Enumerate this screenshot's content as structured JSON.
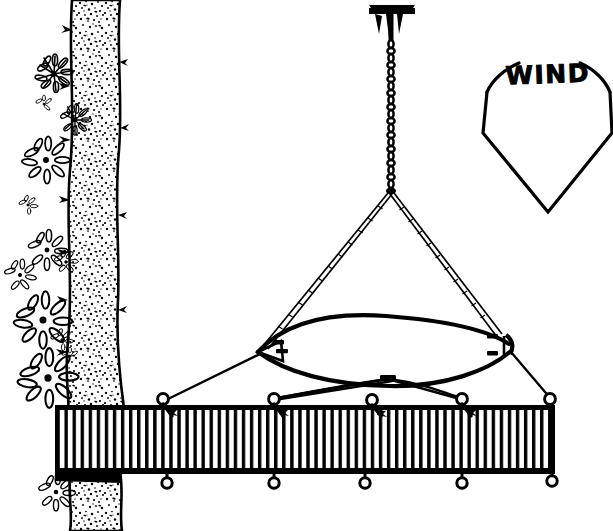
{
  "illustration": {
    "title": "Hammock suspended from ceiling chain over a deck",
    "subject": "hammock-suspension-diagram",
    "line_color": "#000000",
    "background_color": "#ffffff",
    "canvas": {
      "width": 613,
      "height": 531
    }
  },
  "annotations": {
    "wind": {
      "label": "WIND",
      "icon": "wind-direction-arrow",
      "description": "kite-shaped downward pointing wind direction indicator",
      "position": {
        "x": 548,
        "y": 130
      }
    }
  },
  "parts": {
    "ceiling_anchor": {
      "name": "ceiling-mount-bracket",
      "label": "ceiling anchor plate with prongs",
      "position": {
        "x": 391,
        "y": 14
      }
    },
    "chain": {
      "name": "suspension-chain",
      "label": "chain",
      "links": 22,
      "top": {
        "x": 391,
        "y": 38
      },
      "bottom": {
        "x": 391,
        "y": 190
      }
    },
    "bridle": {
      "name": "bridle-ropes",
      "label": "V bridle ropes",
      "apex": {
        "x": 391,
        "y": 191
      },
      "left_end": {
        "x": 264,
        "y": 348
      },
      "right_end": {
        "x": 500,
        "y": 337
      }
    },
    "hammock": {
      "name": "hammock-body",
      "label": "hammock",
      "left_tip": {
        "x": 257,
        "y": 352
      },
      "right_tip": {
        "x": 512,
        "y": 342
      },
      "top_bow_peak": {
        "x": 385,
        "y": 318
      },
      "bottom_sag": {
        "x": 390,
        "y": 385
      }
    },
    "tie_downs": {
      "name": "tie-down-ropes",
      "label": "crossing tie-down ropes",
      "count": 4
    },
    "deck": {
      "name": "deck-platform",
      "label": "planked deck",
      "x": 55,
      "y": 405,
      "width": 500,
      "height": 68,
      "plank_count": 62
    },
    "eye_bolts_top": {
      "name": "deck-eye-bolts",
      "label": "eye bolts on deck surface",
      "count": 5,
      "positions": [
        {
          "x": 163,
          "y": 401
        },
        {
          "x": 274,
          "y": 401
        },
        {
          "x": 372,
          "y": 401
        },
        {
          "x": 462,
          "y": 401
        },
        {
          "x": 549,
          "y": 401
        }
      ]
    },
    "eye_bolts_bottom": {
      "name": "deck-underside-rings",
      "label": "rings below deck edge",
      "count": 5,
      "positions": [
        {
          "x": 167,
          "y": 483
        },
        {
          "x": 274,
          "y": 483
        },
        {
          "x": 365,
          "y": 483
        },
        {
          "x": 462,
          "y": 483
        },
        {
          "x": 552,
          "y": 483
        }
      ]
    },
    "tree": {
      "name": "tree-trunk",
      "label": "textured tree trunk",
      "x": 62,
      "width": 58
    },
    "flowers": {
      "name": "flower-cluster",
      "label": "daisy-like flowers on vine",
      "count": 13
    }
  }
}
